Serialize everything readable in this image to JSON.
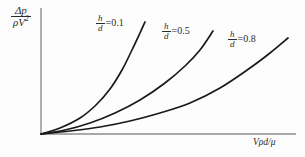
{
  "figure": {
    "background_color": "#fdfdfd",
    "axis_color": "#8c8c8c",
    "curve_color": "#1a1a1a",
    "text_color": "#2b2b2b"
  },
  "axes": {
    "y_label": {
      "numerator": "Δp",
      "denominator_rho_v": "ρV",
      "denominator_exponent": "2"
    },
    "x_label": "Vρd/μ"
  },
  "annotations": [
    {
      "numerator": "h",
      "denominator": "d",
      "equals": "=",
      "value": "0.1"
    },
    {
      "numerator": "h",
      "denominator": "d",
      "equals": "=",
      "value": "0.5"
    },
    {
      "numerator": "h",
      "denominator": "d",
      "equals": "=",
      "value": "0.8"
    }
  ],
  "chart_data": {
    "type": "line",
    "title": "",
    "xlabel": "Vρd/μ",
    "ylabel": "Δp/ρV²",
    "xlim": [
      0,
      1
    ],
    "ylim": [
      0,
      1
    ],
    "grid": false,
    "legend": "inline-annotations",
    "axis_ticks": false,
    "origin": {
      "x": 41,
      "y": 134
    },
    "series": [
      {
        "name": "h/d = 0.1",
        "label": "h/d = 0.1",
        "color": "#1a1a1a",
        "points": [
          [
            41,
            134
          ],
          [
            60,
            128
          ],
          [
            80,
            118
          ],
          [
            96,
            105
          ],
          [
            110,
            89
          ],
          [
            122,
            70
          ],
          [
            132,
            50
          ],
          [
            140,
            33
          ],
          [
            145,
            22
          ]
        ]
      },
      {
        "name": "h/d = 0.5",
        "label": "h/d = 0.5",
        "color": "#1a1a1a",
        "points": [
          [
            41,
            134
          ],
          [
            65,
            130
          ],
          [
            90,
            123
          ],
          [
            115,
            113
          ],
          [
            140,
            100
          ],
          [
            165,
            83
          ],
          [
            185,
            66
          ],
          [
            200,
            50
          ],
          [
            213,
            31
          ]
        ]
      },
      {
        "name": "h/d = 0.8",
        "label": "h/d = 0.8",
        "color": "#1a1a1a",
        "points": [
          [
            41,
            134
          ],
          [
            70,
            131
          ],
          [
            100,
            127
          ],
          [
            130,
            121
          ],
          [
            160,
            113
          ],
          [
            190,
            103
          ],
          [
            220,
            88
          ],
          [
            250,
            68
          ],
          [
            270,
            53
          ],
          [
            288,
            38
          ]
        ]
      }
    ]
  }
}
